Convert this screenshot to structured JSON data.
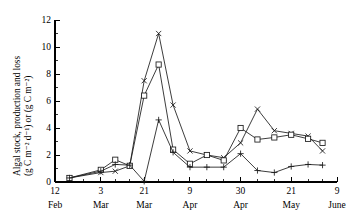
{
  "chart_data": {
    "type": "line",
    "title": "",
    "xlabel": "",
    "ylabel_line1": "Algal stock, production and loss",
    "ylabel_line2": "(g C m⁻² d⁻¹) or (g C m⁻²)",
    "ylim": [
      0,
      12
    ],
    "ytick_labels": [
      "0",
      "2",
      "4",
      "6",
      "8",
      "10",
      "12"
    ],
    "ytick_values": [
      0,
      2,
      4,
      6,
      8,
      10,
      12
    ],
    "yminor_values": [
      1,
      3,
      5,
      7,
      9,
      11
    ],
    "grid": false,
    "legend_position": "none",
    "xaxis": {
      "unit": "days",
      "xlim": [
        0,
        117
      ],
      "major_ticks": [
        {
          "value": 0,
          "day_label": "12",
          "month_label": "Feb"
        },
        {
          "value": 19,
          "day_label": "3",
          "month_label": "Mar"
        },
        {
          "value": 37,
          "day_label": "21",
          "month_label": "Mar"
        },
        {
          "value": 56,
          "day_label": "9",
          "month_label": "Apr"
        },
        {
          "value": 77,
          "day_label": "30",
          "month_label": "Apr"
        },
        {
          "value": 98,
          "day_label": "21",
          "month_label": "May"
        },
        {
          "value": 117,
          "day_label": "9",
          "month_label": "June"
        }
      ],
      "minor_ticks": [
        6,
        12,
        25,
        31,
        43,
        49,
        63,
        70,
        84,
        91,
        105,
        111
      ]
    },
    "series": [
      {
        "name": "algal-stock",
        "marker": "cross",
        "points": [
          {
            "x": 6,
            "y": 0.3
          },
          {
            "x": 19,
            "y": 0.7
          },
          {
            "x": 25,
            "y": 0.8
          },
          {
            "x": 31,
            "y": 1.2
          },
          {
            "x": 37,
            "y": 7.5
          },
          {
            "x": 43,
            "y": 11.0
          },
          {
            "x": 49,
            "y": 5.7
          },
          {
            "x": 56,
            "y": 2.3
          },
          {
            "x": 63,
            "y": 2.0
          },
          {
            "x": 70,
            "y": 1.8
          },
          {
            "x": 77,
            "y": 2.9
          },
          {
            "x": 84,
            "y": 5.4
          },
          {
            "x": 91,
            "y": 3.8
          },
          {
            "x": 98,
            "y": 3.6
          },
          {
            "x": 105,
            "y": 3.4
          },
          {
            "x": 111,
            "y": 2.3
          }
        ]
      },
      {
        "name": "production",
        "marker": "square",
        "points": [
          {
            "x": 6,
            "y": 0.3
          },
          {
            "x": 19,
            "y": 0.9
          },
          {
            "x": 25,
            "y": 1.65
          },
          {
            "x": 31,
            "y": 1.2
          },
          {
            "x": 37,
            "y": 6.4
          },
          {
            "x": 43,
            "y": 8.7
          },
          {
            "x": 49,
            "y": 2.4
          },
          {
            "x": 56,
            "y": 1.35
          },
          {
            "x": 63,
            "y": 2.0
          },
          {
            "x": 70,
            "y": 1.6
          },
          {
            "x": 77,
            "y": 4.0
          },
          {
            "x": 84,
            "y": 3.15
          },
          {
            "x": 91,
            "y": 3.3
          },
          {
            "x": 98,
            "y": 3.5
          },
          {
            "x": 105,
            "y": 3.2
          },
          {
            "x": 111,
            "y": 2.9
          }
        ]
      },
      {
        "name": "loss",
        "marker": "plus",
        "points": [
          {
            "x": 6,
            "y": 0.3
          },
          {
            "x": 19,
            "y": 0.8
          },
          {
            "x": 25,
            "y": 1.3
          },
          {
            "x": 31,
            "y": 1.25
          },
          {
            "x": 37,
            "y": 0.05
          },
          {
            "x": 43,
            "y": 4.6
          },
          {
            "x": 49,
            "y": 2.2
          },
          {
            "x": 56,
            "y": 1.1
          },
          {
            "x": 63,
            "y": 1.1
          },
          {
            "x": 70,
            "y": 1.1
          },
          {
            "x": 77,
            "y": 2.1
          },
          {
            "x": 84,
            "y": 0.85
          },
          {
            "x": 91,
            "y": 0.7
          },
          {
            "x": 98,
            "y": 1.15
          },
          {
            "x": 105,
            "y": 1.3
          },
          {
            "x": 111,
            "y": 1.25
          }
        ]
      }
    ]
  }
}
